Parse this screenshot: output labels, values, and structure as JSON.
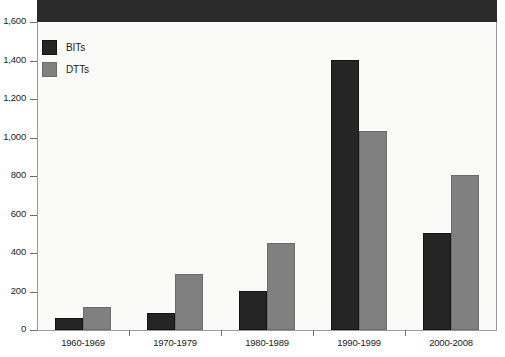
{
  "chart_data": {
    "type": "bar",
    "title": "",
    "xlabel": "",
    "ylabel": "",
    "categories": [
      "1960-1969",
      "1970-1979",
      "1980-1989",
      "1990-1999",
      "2000-2008"
    ],
    "series": [
      {
        "name": "BITs",
        "color": "#252525",
        "values": [
          65,
          88,
          203,
          1403,
          504
        ]
      },
      {
        "name": "DTTs",
        "color": "#808080",
        "values": [
          120,
          290,
          452,
          1034,
          805
        ]
      }
    ],
    "ylim": [
      0,
      1600
    ],
    "ytick_values": [
      0,
      200,
      400,
      600,
      800,
      1000,
      1200,
      1400,
      1600
    ],
    "ytick_labels": [
      "0",
      "200",
      "400",
      "600",
      "800",
      "1,000",
      "1,200",
      "1,400",
      "1,600"
    ],
    "grid": false,
    "legend_position": "top-left",
    "legend_entries": [
      "BITs",
      "DTTs"
    ],
    "annotations": []
  },
  "legend": {
    "items": [
      {
        "label": "BITs",
        "swatch": "legend-swatch-bits"
      },
      {
        "label": "DTTs",
        "swatch": "legend-swatch-dtts"
      }
    ]
  },
  "colors": {
    "bits": "#252525",
    "dtts": "#808080",
    "plot_background": "#fafaf8",
    "frame": "#9a9a9a",
    "top_band": "#2b2b2b"
  }
}
